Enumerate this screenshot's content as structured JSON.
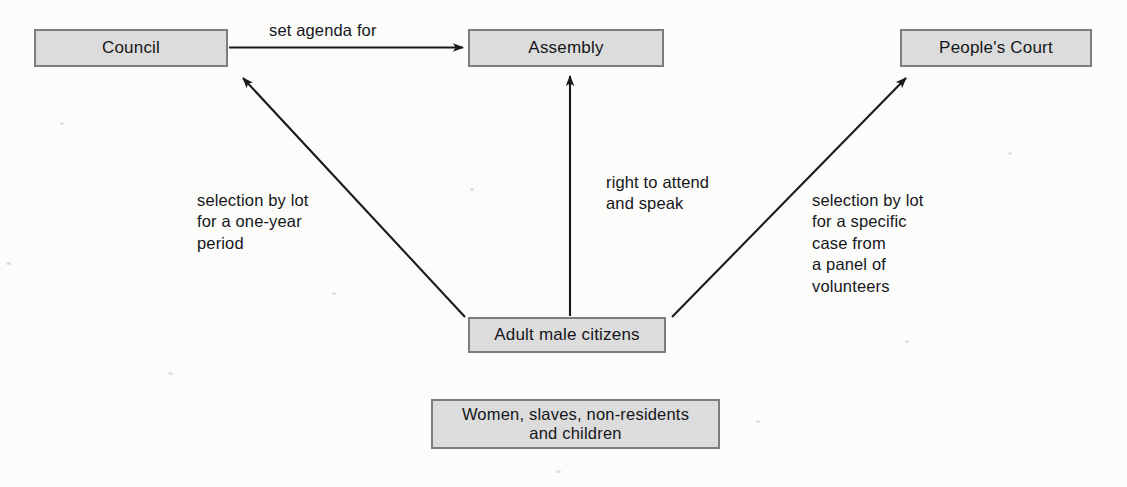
{
  "diagram": {
    "background_color": "#fcfcfb",
    "box_fill_color": "#dcdcdc",
    "box_border_color": "#7d7d7d",
    "text_color": "#15161a",
    "arrow_color": "#1a1a1a"
  },
  "nodes": [
    {
      "id": "council",
      "label": "Council"
    },
    {
      "id": "assembly",
      "label": "Assembly"
    },
    {
      "id": "court",
      "label": "People's Court"
    },
    {
      "id": "citizens",
      "label": "Adult male citizens"
    },
    {
      "id": "excluded",
      "label": "Women, slaves, non-residents\nand children"
    }
  ],
  "edges": [
    {
      "id": "council-to-assembly",
      "from": "council",
      "to": "assembly",
      "label": "set agenda for",
      "direction": "horizontal-right"
    },
    {
      "id": "citizens-to-assembly",
      "from": "citizens",
      "to": "assembly",
      "label": "right to attend\nand speak",
      "direction": "vertical-up"
    },
    {
      "id": "citizens-to-council",
      "from": "citizens",
      "to": "council",
      "label": "selection by lot\nfor a one-year\nperiod",
      "direction": "diagonal-up-left"
    },
    {
      "id": "citizens-to-court",
      "from": "citizens",
      "to": "court",
      "label": "selection by lot\nfor a specific\ncase from\na panel of\nvolunteers",
      "direction": "diagonal-up-right"
    }
  ]
}
